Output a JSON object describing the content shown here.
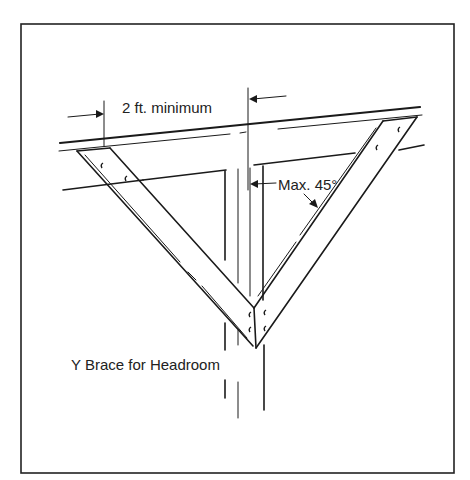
{
  "figure": {
    "title": "Y Brace for Headroom",
    "labels": {
      "dimension": "2 ft. minimum",
      "angle": "Max. 45°",
      "caption": "Y Brace for Headroom"
    },
    "colors": {
      "line": "#1a1a1a",
      "background": "#ffffff",
      "frame": "#222222"
    },
    "elements": [
      "frame-border",
      "top-beam",
      "lower-beam",
      "vertical-post",
      "left-brace",
      "right-brace",
      "dimension-arrows",
      "angle-arrows",
      "nails"
    ]
  }
}
